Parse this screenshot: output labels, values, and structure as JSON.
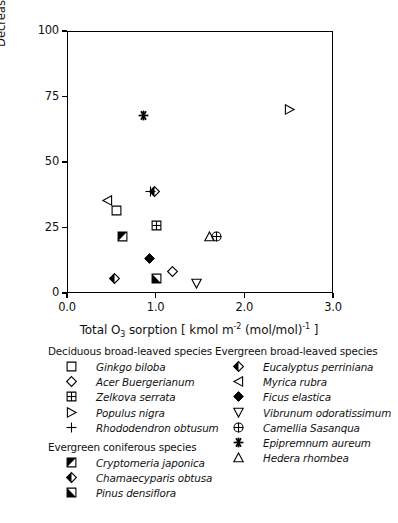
{
  "chart_data": {
    "type": "scatter",
    "title": "",
    "xlabel": "Total O3 sorption [ kmol m-2 (mol/mol)-1 ]",
    "ylabel": "Decrease in net photosynthesis rate [ % ]",
    "xlim": [
      0.0,
      3.0
    ],
    "ylim": [
      0,
      100
    ],
    "xticks": [
      "0.0",
      "1.0",
      "2.0",
      "3.0"
    ],
    "yticks": [
      "0",
      "25",
      "50",
      "75",
      "100"
    ],
    "grid": false,
    "legend_position": "below-plot",
    "points": [
      {
        "name": "Ginkgo biloba",
        "group": "deciduous_broad_leaved",
        "marker": "open-square",
        "x": 0.55,
        "y": 32.0
      },
      {
        "name": "Acer Buergerianum",
        "group": "deciduous_broad_leaved",
        "marker": "open-diamond",
        "x": 1.18,
        "y": 8.5
      },
      {
        "name": "Zelkova serrata",
        "group": "deciduous_broad_leaved",
        "marker": "crossed-square",
        "x": 1.0,
        "y": 26.0
      },
      {
        "name": "Populus nigra",
        "group": "deciduous_broad_leaved",
        "marker": "open-triangle-right",
        "x": 2.5,
        "y": 70.5
      },
      {
        "name": "Rhododendron obtusum",
        "group": "deciduous_broad_leaved",
        "marker": "plus",
        "x": 0.93,
        "y": 39.0
      },
      {
        "name": "Cryptomeria japonica",
        "group": "evergreen_coniferous",
        "marker": "half-square-ul",
        "x": 0.62,
        "y": 22.0
      },
      {
        "name": "Chamaecyparis obtusa",
        "group": "evergreen_coniferous",
        "marker": "half-diamond",
        "x": 0.52,
        "y": 6.0
      },
      {
        "name": "Pinus densiflora",
        "group": "evergreen_coniferous",
        "marker": "half-square-ll",
        "x": 1.0,
        "y": 6.0
      },
      {
        "name": "Eucalyptus perriniana",
        "group": "evergreen_broad_leaved",
        "marker": "half-diamond",
        "x": 0.98,
        "y": 39.0
      },
      {
        "name": "Myrica rubra",
        "group": "evergreen_broad_leaved",
        "marker": "open-triangle-left",
        "x": 0.45,
        "y": 35.5
      },
      {
        "name": "Ficus elastica",
        "group": "evergreen_broad_leaved",
        "marker": "filled-diamond",
        "x": 0.92,
        "y": 13.5
      },
      {
        "name": "Vibrunum odoratissimum",
        "group": "evergreen_broad_leaved",
        "marker": "open-triangle-down",
        "x": 1.45,
        "y": 4.0
      },
      {
        "name": "Camellia Sasanqua",
        "group": "evergreen_broad_leaved",
        "marker": "circle-plus",
        "x": 1.68,
        "y": 22.0
      },
      {
        "name": "Epipremnum aureum",
        "group": "evergreen_broad_leaved",
        "marker": "asterisk",
        "x": 0.85,
        "y": 68.0
      },
      {
        "name": "Hedera rhombea",
        "group": "evergreen_broad_leaved",
        "marker": "open-triangle-up",
        "x": 1.6,
        "y": 22.0
      }
    ]
  },
  "axes": {
    "y_title": "Decrease in net photosynthesis rate [ % ]",
    "x_title_pre": "Total O",
    "x_title_sub": "3",
    "x_title_mid": " sorption [ kmol m",
    "x_title_sup1": "-2",
    "x_title_mid2": " (mol/mol)",
    "x_title_sup2": "-1",
    "x_title_end": " ]",
    "y_labels": [
      "100",
      "75",
      "50",
      "25",
      "0"
    ],
    "x_labels": [
      "0.0",
      "1.0",
      "2.0",
      "3.0"
    ]
  },
  "legend": {
    "deciduous": {
      "header": "Deciduous broad-leaved species",
      "items": [
        {
          "label": "Ginkgo biloba",
          "marker": "open-square"
        },
        {
          "label": "Acer Buergerianum",
          "marker": "open-diamond"
        },
        {
          "label": "Zelkova serrata",
          "marker": "crossed-square"
        },
        {
          "label": "Populus nigra",
          "marker": "open-triangle-right"
        },
        {
          "label": "Rhododendron obtusum",
          "marker": "plus"
        }
      ]
    },
    "coniferous": {
      "header": "Evergreen coniferous species",
      "items": [
        {
          "label": "Cryptomeria japonica",
          "marker": "half-square-ul"
        },
        {
          "label": "Chamaecyparis obtusa",
          "marker": "half-diamond"
        },
        {
          "label": "Pinus densiflora",
          "marker": "half-square-ll"
        }
      ]
    },
    "evergreen": {
      "header": "Evergreen broad-leaved species",
      "items": [
        {
          "label": "Eucalyptus perriniana",
          "marker": "half-diamond"
        },
        {
          "label": "Myrica rubra",
          "marker": "open-triangle-left"
        },
        {
          "label": "Ficus elastica",
          "marker": "filled-diamond"
        },
        {
          "label": "Vibrunum odoratissimum",
          "marker": "open-triangle-down"
        },
        {
          "label": "Camellia Sasanqua",
          "marker": "circle-plus"
        },
        {
          "label": "Epipremnum aureum",
          "marker": "asterisk"
        },
        {
          "label": "Hedera rhombea",
          "marker": "open-triangle-up"
        }
      ]
    }
  },
  "colors": {
    "ink": "#000000",
    "background": "#ffffff"
  }
}
